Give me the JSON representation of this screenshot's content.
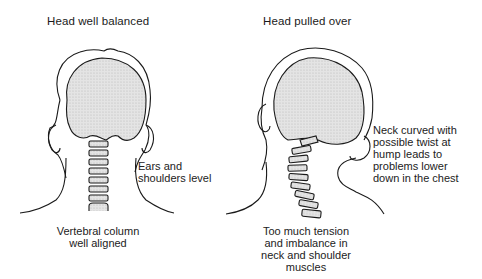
{
  "figures": [
    {
      "id": "balanced",
      "title": "Head well balanced",
      "labels": {
        "side": [
          "Ears and",
          "shoulders level"
        ],
        "bottom": [
          "Vertebral column",
          "well aligned"
        ]
      }
    },
    {
      "id": "pulled",
      "title": "Head pulled over",
      "labels": {
        "side": [
          "Neck curved with",
          "possible twist at",
          "hump leads to",
          "problems lower",
          "down in the chest"
        ],
        "bottom": [
          "Too much tension",
          "and imbalance in",
          "neck and shoulder",
          "muscles"
        ]
      }
    }
  ],
  "colors": {
    "line": "#1a1a1a",
    "fill": "#dedede",
    "background": "#ffffff"
  }
}
